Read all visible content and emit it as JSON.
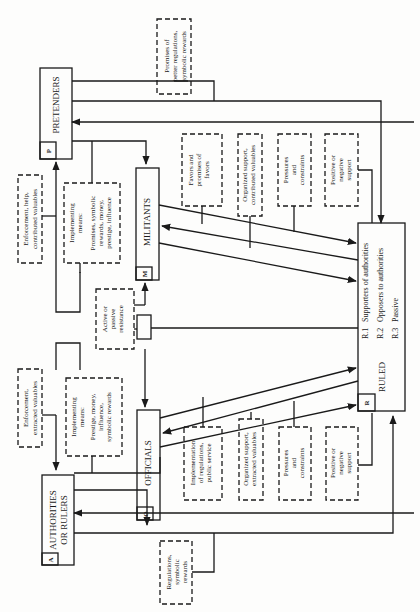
{
  "diagram": {
    "orientation": "rotated 90 degrees counter-clockwise",
    "actors": {
      "authorities": {
        "code": "A",
        "label_line1": "AUTHORITIES",
        "label_line2": "OR RULERS"
      },
      "officials": {
        "code": "O",
        "label": "OFFICIALS"
      },
      "militants": {
        "code": "M",
        "label": "MILITANTS"
      },
      "pretenders": {
        "code": "P",
        "label": "PRETENDERS"
      },
      "ruled": {
        "code": "R",
        "label": "RULED",
        "subgroups": [
          {
            "code": "R.1",
            "label": "Supporters of authorities"
          },
          {
            "code": "R.2",
            "label": "Opposers to authorities"
          },
          {
            "code": "R.3",
            "label": "Passive"
          }
        ]
      }
    },
    "flows": {
      "regulations": [
        "Regulations,",
        "symbolic",
        "rewards"
      ],
      "promises_better": [
        "Promises of",
        "better regulations,",
        "symbolic rewards"
      ],
      "enforcement_extracted": [
        "Enforcement,",
        "extracted valuables"
      ],
      "enforcement_help": [
        "Enforcement, help,",
        "contributed valuables"
      ],
      "impl_means_officials": [
        "Implementing",
        "means:",
        "Prestige, money,",
        "influence,",
        "symbolic rewards"
      ],
      "impl_means_militants": [
        "Implementing",
        "means:",
        "Promises, symbolic",
        "rewards, money,",
        "prestige, influence"
      ],
      "resistance": [
        "Active or",
        "passive",
        "resistance"
      ],
      "impl_regulations": [
        "Implementation",
        "of regulations,",
        "public service"
      ],
      "org_support_extracted": [
        "Organized support,",
        "extracted valuables"
      ],
      "pressures_officials": [
        "Pressures",
        "and",
        "constraints"
      ],
      "support_officials": [
        "Positive or",
        "negative",
        "support"
      ],
      "favors": [
        "Favors and",
        "promises of",
        "favors"
      ],
      "org_support_contributed": [
        "Organized support,",
        "contributed valuables"
      ],
      "pressures_militants": [
        "Pressures",
        "and",
        "constraints"
      ],
      "support_militants": [
        "Positive or",
        "negative",
        "support"
      ]
    }
  }
}
